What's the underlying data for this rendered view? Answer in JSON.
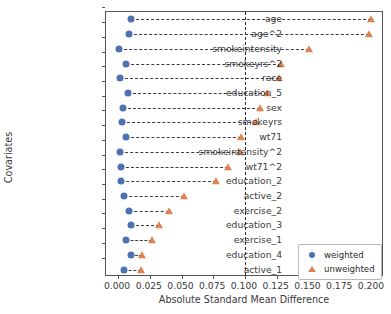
{
  "chart_data": {
    "type": "scatter",
    "title": "",
    "xlabel": "Absolute Standard Mean Difference",
    "ylabel": "Covariates",
    "xlim": [
      -0.0095,
      0.2095
    ],
    "xticks": [
      0.0,
      0.025,
      0.05,
      0.075,
      0.1,
      0.125,
      0.15,
      0.175,
      0.2
    ],
    "xticklabels": [
      "0.000",
      "0.025",
      "0.050",
      "0.075",
      "0.100",
      "0.125",
      "0.150",
      "0.175",
      "0.200"
    ],
    "grid": false,
    "reference_line": 0.1,
    "legend_position": "lower right",
    "categories": [
      "age",
      "age^2",
      "smokeintensity",
      "smokeyrs^2",
      "race",
      "education_5",
      "sex",
      "smokeyrs",
      "wt71",
      "smokeintensity^2",
      "wt71^2",
      "education_2",
      "active_2",
      "exercise_2",
      "education_3",
      "exercise_1",
      "education_4",
      "active_1"
    ],
    "series": [
      {
        "name": "weighted",
        "marker": "circle",
        "color": "#4c72b0",
        "values": [
          0.01,
          0.0085,
          0.001,
          0.0065,
          0.0012,
          0.0075,
          0.0035,
          0.003,
          0.0064,
          0.0012,
          0.0022,
          0.002,
          0.0048,
          0.0085,
          0.01,
          0.006,
          0.0103,
          0.0045
        ]
      },
      {
        "name": "unweighted",
        "marker": "triangle",
        "color": "#dd8452",
        "values": [
          0.1995,
          0.198,
          0.1505,
          0.128,
          0.127,
          0.1175,
          0.1115,
          0.109,
          0.0965,
          0.096,
          0.087,
          0.0775,
          0.052,
          0.04,
          0.0325,
          0.027,
          0.0185,
          0.018
        ]
      }
    ]
  },
  "legend": {
    "items": [
      {
        "label": "weighted"
      },
      {
        "label": "unweighted"
      }
    ]
  }
}
